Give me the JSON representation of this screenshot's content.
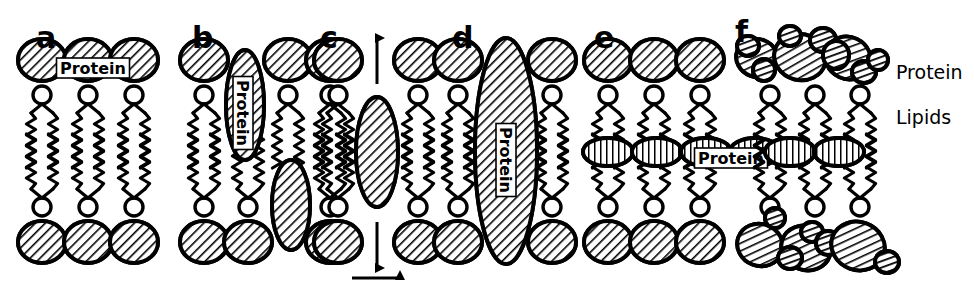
{
  "figure": {
    "background_color": "#ffffff",
    "ink_color": "#000000",
    "width": 974,
    "height": 292
  },
  "panels": [
    {
      "letter": "a",
      "letter_x": 36,
      "letter_y": 48,
      "description": "Protein coating the outer surfaces of the lipid bilayer",
      "label": "Protein",
      "label_x": 93,
      "label_y": 68,
      "label_rotation": 0,
      "origin_x": 28,
      "top_heads": [
        {
          "cx": 42,
          "cy": 60,
          "rx": 24,
          "ry": 21
        },
        {
          "cx": 88,
          "cy": 60,
          "rx": 24,
          "ry": 21
        },
        {
          "cx": 134,
          "cy": 60,
          "rx": 24,
          "ry": 21
        }
      ],
      "bottom_heads": [
        {
          "cx": 42,
          "cy": 242,
          "rx": 24,
          "ry": 21
        },
        {
          "cx": 88,
          "cy": 242,
          "rx": 24,
          "ry": 21
        },
        {
          "cx": 134,
          "cy": 242,
          "rx": 24,
          "ry": 21
        }
      ],
      "upper_lipids": [
        42,
        88,
        134
      ],
      "lower_lipids": [
        42,
        88,
        134
      ],
      "vertical_proteins": [],
      "mid_proteins": [],
      "clusters": []
    },
    {
      "letter": "b",
      "letter_x": 192,
      "letter_y": 48,
      "description": "Protein partially penetrating one leaflet of the bilayer",
      "label": "Protein",
      "label_x": 243,
      "label_y": 113,
      "label_rotation": 90,
      "origin_x": 190,
      "top_heads": [
        {
          "cx": 204,
          "cy": 60,
          "rx": 24,
          "ry": 21
        },
        {
          "cx": 288,
          "cy": 60,
          "rx": 24,
          "ry": 21
        },
        {
          "cx": 330,
          "cy": 60,
          "rx": 24,
          "ry": 21
        }
      ],
      "bottom_heads": [
        {
          "cx": 204,
          "cy": 242,
          "rx": 24,
          "ry": 21
        },
        {
          "cx": 248,
          "cy": 242,
          "rx": 24,
          "ry": 21
        },
        {
          "cx": 330,
          "cy": 242,
          "rx": 24,
          "ry": 21
        }
      ],
      "upper_lipids": [
        204,
        288,
        330
      ],
      "lower_lipids": [
        204,
        248,
        330
      ],
      "vertical_proteins": [
        {
          "cx": 245,
          "cy": 105,
          "rx": 19,
          "ry": 55
        },
        {
          "cx": 291,
          "cy": 205,
          "rx": 19,
          "ry": 45
        }
      ],
      "mid_proteins": [],
      "clusters": []
    },
    {
      "letter": "c",
      "letter_x": 320,
      "letter_y": 48,
      "description": "Free protein particle able to diffuse vertically and laterally",
      "label": "",
      "origin_x": 320,
      "top_heads": [
        {
          "cx": 338,
          "cy": 60,
          "rx": 24,
          "ry": 21
        },
        {
          "cx": 418,
          "cy": 60,
          "rx": 24,
          "ry": 21
        }
      ],
      "bottom_heads": [
        {
          "cx": 338,
          "cy": 242,
          "rx": 24,
          "ry": 21
        },
        {
          "cx": 418,
          "cy": 242,
          "rx": 24,
          "ry": 21
        }
      ],
      "upper_lipids": [
        338,
        418
      ],
      "lower_lipids": [
        338,
        418
      ],
      "vertical_proteins": [
        {
          "cx": 377,
          "cy": 152,
          "rx": 21,
          "ry": 55
        }
      ],
      "mid_proteins": [],
      "clusters": [],
      "arrows": {
        "vertical": {
          "x": 377,
          "y_top": 38,
          "y_bottom": 268,
          "double_headed": true
        },
        "horizontal": {
          "y": 278,
          "x_start": 352,
          "x_end": 400,
          "double_headed": false
        }
      }
    },
    {
      "letter": "d",
      "letter_x": 452,
      "letter_y": 48,
      "description": "Large transmembrane protein spanning the entire bilayer",
      "label": "Protein",
      "label_x": 506,
      "label_y": 160,
      "label_rotation": 90,
      "origin_x": 440,
      "top_heads": [
        {
          "cx": 458,
          "cy": 60,
          "rx": 24,
          "ry": 21
        },
        {
          "cx": 552,
          "cy": 60,
          "rx": 24,
          "ry": 21
        }
      ],
      "bottom_heads": [
        {
          "cx": 458,
          "cy": 242,
          "rx": 24,
          "ry": 21
        },
        {
          "cx": 552,
          "cy": 242,
          "rx": 24,
          "ry": 21
        }
      ],
      "upper_lipids": [
        458,
        552
      ],
      "lower_lipids": [
        458,
        552
      ],
      "vertical_proteins": [
        {
          "cx": 506,
          "cy": 151,
          "rx": 31,
          "ry": 113
        }
      ],
      "mid_proteins": [],
      "clusters": []
    },
    {
      "letter": "e",
      "letter_x": 594,
      "letter_y": 48,
      "description": "Protein layer sandwiched between the two lipid leaflets",
      "label": "Protein",
      "label_x": 731,
      "label_y": 158,
      "label_rotation": 0,
      "origin_x": 586,
      "top_heads": [
        {
          "cx": 608,
          "cy": 60,
          "rx": 24,
          "ry": 21
        },
        {
          "cx": 654,
          "cy": 60,
          "rx": 24,
          "ry": 21
        },
        {
          "cx": 700,
          "cy": 60,
          "rx": 24,
          "ry": 21
        }
      ],
      "bottom_heads": [
        {
          "cx": 608,
          "cy": 242,
          "rx": 24,
          "ry": 21
        },
        {
          "cx": 654,
          "cy": 242,
          "rx": 24,
          "ry": 21
        },
        {
          "cx": 700,
          "cy": 242,
          "rx": 24,
          "ry": 21
        }
      ],
      "upper_lipids": [
        608,
        654,
        700
      ],
      "lower_lipids": [
        608,
        654,
        700
      ],
      "vertical_proteins": [],
      "mid_proteins": [
        {
          "cx": 608,
          "cy": 152,
          "rx": 25,
          "ry": 14
        },
        {
          "cx": 657,
          "cy": 152,
          "rx": 25,
          "ry": 14
        },
        {
          "cx": 706,
          "cy": 152,
          "rx": 25,
          "ry": 14
        },
        {
          "cx": 755,
          "cy": 152,
          "rx": 25,
          "ry": 14
        }
      ],
      "clusters": []
    },
    {
      "letter": "f",
      "letter_x": 735,
      "letter_y": 42,
      "description": "Globular protein clusters adsorbed on both bilayer surfaces",
      "label": "",
      "origin_x": 744,
      "top_heads": [],
      "bottom_heads": [],
      "upper_lipids": [
        770,
        815,
        860
      ],
      "lower_lipids": [
        770,
        815,
        860
      ],
      "vertical_proteins": [],
      "mid_proteins": [
        {
          "cx": 790,
          "cy": 152,
          "rx": 25,
          "ry": 14
        },
        {
          "cx": 839,
          "cy": 152,
          "rx": 25,
          "ry": 14
        }
      ],
      "clusters": [
        {
          "row": "top",
          "shapes": [
            {
              "cx": 757,
              "cy": 58,
              "rx": 21,
              "ry": 19,
              "angle": 20,
              "dark": false
            },
            {
              "cx": 748,
              "cy": 46,
              "rx": 11,
              "ry": 10,
              "angle": 0,
              "dark": true
            },
            {
              "cx": 764,
              "cy": 70,
              "rx": 11,
              "ry": 11,
              "angle": 0,
              "dark": true
            },
            {
              "cx": 800,
              "cy": 57,
              "rx": 26,
              "ry": 23,
              "angle": 15,
              "dark": false
            },
            {
              "cx": 790,
              "cy": 36,
              "rx": 11,
              "ry": 10,
              "angle": 0,
              "dark": true
            },
            {
              "cx": 823,
              "cy": 40,
              "rx": 13,
              "ry": 12,
              "angle": 0,
              "dark": true
            },
            {
              "cx": 848,
              "cy": 58,
              "rx": 23,
              "ry": 21,
              "angle": 25,
              "dark": false
            },
            {
              "cx": 836,
              "cy": 55,
              "rx": 13,
              "ry": 14,
              "angle": 0,
              "dark": true
            },
            {
              "cx": 864,
              "cy": 72,
              "rx": 12,
              "ry": 11,
              "angle": 0,
              "dark": true
            },
            {
              "cx": 878,
              "cy": 60,
              "rx": 10,
              "ry": 10,
              "angle": 0,
              "dark": true
            }
          ]
        },
        {
          "row": "bottom",
          "shapes": [
            {
              "cx": 760,
              "cy": 245,
              "rx": 23,
              "ry": 21,
              "angle": 20,
              "dark": false
            },
            {
              "cx": 806,
              "cy": 248,
              "rx": 25,
              "ry": 22,
              "angle": 20,
              "dark": false
            },
            {
              "cx": 790,
              "cy": 258,
              "rx": 12,
              "ry": 11,
              "angle": 0,
              "dark": true
            },
            {
              "cx": 812,
              "cy": 232,
              "rx": 11,
              "ry": 10,
              "angle": 0,
              "dark": true
            },
            {
              "cx": 828,
              "cy": 243,
              "rx": 12,
              "ry": 12,
              "angle": 0,
              "dark": true
            },
            {
              "cx": 858,
              "cy": 246,
              "rx": 27,
              "ry": 24,
              "angle": 20,
              "dark": false
            },
            {
              "cx": 887,
              "cy": 262,
              "rx": 12,
              "ry": 11,
              "angle": 0,
              "dark": true
            },
            {
              "cx": 775,
              "cy": 218,
              "rx": 10,
              "ry": 10,
              "angle": 0,
              "dark": true
            }
          ]
        }
      ]
    }
  ],
  "side_labels": [
    {
      "text": "Protein",
      "x": 896,
      "y": 79
    },
    {
      "text": "Lipids",
      "x": 896,
      "y": 124
    }
  ],
  "lipid_geometry": {
    "head_radius": 9,
    "head_offset_upper": 95,
    "head_offset_lower": 207,
    "tail_length": 55,
    "tail_spread": 11
  }
}
